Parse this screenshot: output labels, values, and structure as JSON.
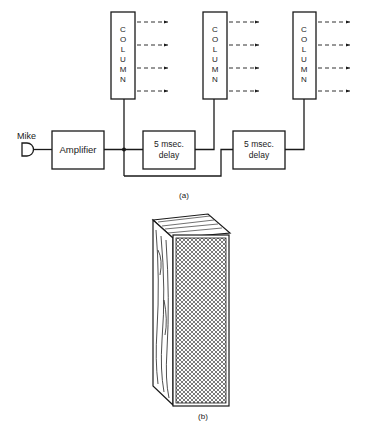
{
  "figure_a": {
    "caption": "(a)",
    "mike_label": "Mike",
    "amplifier_label": "Amplifier",
    "delay_boxes": [
      {
        "line1": "5 msec.",
        "line2": "delay"
      },
      {
        "line1": "5 msec.",
        "line2": "delay"
      }
    ],
    "columns": [
      {
        "letters": [
          "C",
          "O",
          "L",
          "U",
          "M",
          "N"
        ]
      },
      {
        "letters": [
          "C",
          "O",
          "L",
          "U",
          "M",
          "N"
        ]
      },
      {
        "letters": [
          "C",
          "O",
          "L",
          "U",
          "M",
          "N"
        ]
      }
    ],
    "arrows_per_column": 4
  },
  "figure_b": {
    "caption": "(b)",
    "description": "speaker column cabinet with wood-grain side and cross-hatched grille"
  },
  "colors": {
    "ink": "#1a1a1a",
    "background": "#ffffff"
  }
}
